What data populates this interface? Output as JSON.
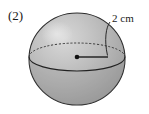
{
  "figure": {
    "item_number": "(2)",
    "shape_name": "sphere",
    "dimension_label": "2 cm",
    "dimension_value": 2,
    "dimension_unit": "cm",
    "dimension_kind": "radius",
    "colors": {
      "background": "#ffffff",
      "sphere_fill_light": "#c9c9c9",
      "sphere_fill_mid": "#b4b4b4",
      "sphere_fill_dark": "#9a9a9a",
      "outline": "#2b2b2b",
      "equator_hidden": "#3a3a3a",
      "radius_line": "#1a1a1a",
      "center_dot": "#111111",
      "text": "#1a1a1a"
    },
    "geometry": {
      "sphere_center_x": 77,
      "sphere_center_y": 59,
      "sphere_radius_x": 48,
      "sphere_radius_y": 46,
      "equator_center_y": 57,
      "equator_radius_y": 14,
      "center_dot_x": 77,
      "center_dot_y": 57,
      "radius_end_x": 108,
      "radius_end_y": 57
    },
    "elements": {
      "equator_hidden_arc": "dashed upper half of equator ellipse",
      "equator_visible_arc": "solid lower half of equator ellipse",
      "radius_segment": "horizontal line from center dot to sphere equator edge",
      "leader_line": "curved callout from 2 cm label to radius endpoint",
      "highlight": "specular highlight upper-left of sphere"
    }
  }
}
